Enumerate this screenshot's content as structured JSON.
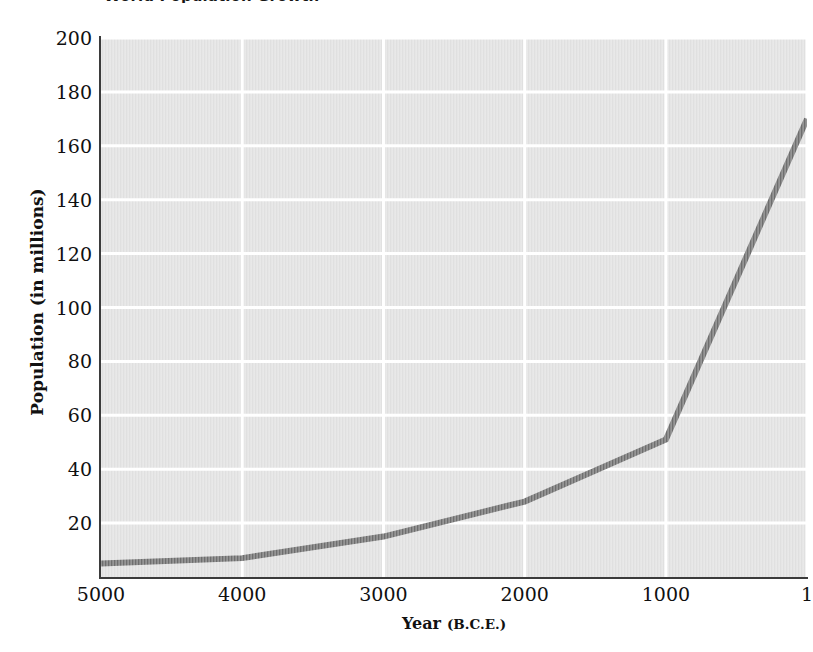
{
  "chart_data": {
    "type": "line",
    "title": "World Population Growth",
    "xlabel": "Year",
    "xlabel_unit": "(B.C.E.)",
    "ylabel": "Population (in millions)",
    "x": [
      5000,
      4000,
      3000,
      2000,
      1000,
      1
    ],
    "values": [
      5,
      7,
      15,
      28,
      51,
      170
    ],
    "xtick_labels": [
      "5000",
      "4000",
      "3000",
      "2000",
      "1000",
      "1"
    ],
    "ytick_labels": [
      "200",
      "180",
      "160",
      "140",
      "120",
      "100",
      "80",
      "60",
      "40",
      "20"
    ],
    "ytick_values": [
      200,
      180,
      160,
      140,
      120,
      100,
      80,
      60,
      40,
      20
    ],
    "ylim": [
      0,
      200
    ],
    "xlim": [
      5000,
      1
    ],
    "x_axis_inverted": true,
    "grid": true,
    "gridline_color": "#ffffff",
    "plot_background": "#e0e0e0",
    "line_color": "#6e6e6e",
    "line_width": 6,
    "axis_color": "#3b3b3b",
    "legend": "none",
    "series_name": "World population"
  }
}
